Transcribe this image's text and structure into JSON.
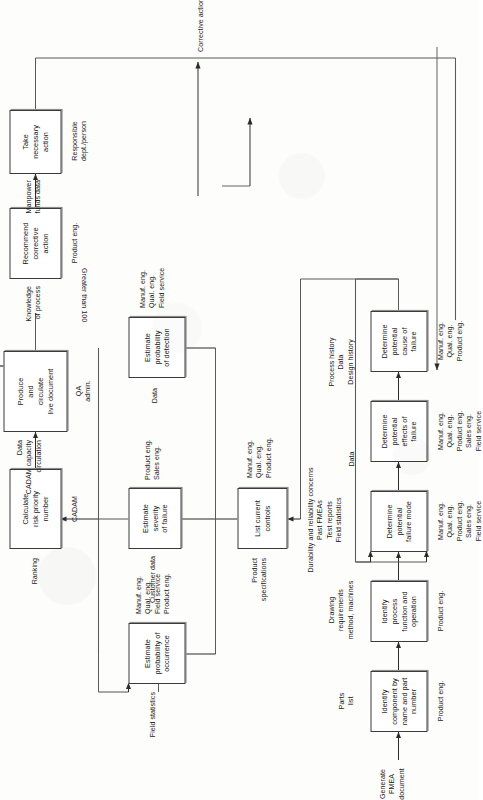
{
  "diagram": {
    "title_block": "Durability and reliability concerns\nPast FMEAs\nTest reports\nField statistics",
    "start_label": "Generate\nFMEA\ndocument",
    "terminal_label": "Less than 100\n\nNo action required",
    "loop_label": "Corrective action data",
    "branch_label": "Greater than 100",
    "stroke_color": "#3a3a3a",
    "text_color": "#161616",
    "boxes": [
      {
        "id": "b1",
        "text": "Identify\ncomponent by\nname and part\nnumber",
        "input": "Parts\nlist",
        "resource": "Product eng."
      },
      {
        "id": "b2",
        "text": "Identify\nprocess\nfunction and\noperation",
        "input": "Drawing\nrequirements\nmethod, machines",
        "resource": "Product eng."
      },
      {
        "id": "b3",
        "text": "Determine\npotential\nfailure mode",
        "input": "Durability and reliability concerns\nPast FMEAs\nTest reports\nField statistics",
        "resource": "Manuf. eng.\nQual. eng.\nProduct eng.\nSales eng.\nField service"
      },
      {
        "id": "b4",
        "text": "Determine\npotential\neffects of\nfailure",
        "input": "Data",
        "resource": "Manuf. eng.\nQual. eng.\nProduct eng.\nSales eng.\nField service"
      },
      {
        "id": "b5",
        "text": "Determine\npotential\ncause of\nfailure",
        "input": "Process history\nData\nDesign history",
        "resource": "Manuf. eng.\nQual. eng.\nProduct eng."
      },
      {
        "id": "b6",
        "text": "List current\ncontrols",
        "input": "Product\nspecifications",
        "resource": "Manuf. eng.\nQual. eng.\nProduct eng."
      },
      {
        "id": "b7",
        "text": "Estimate\nprobability of\noccurrence",
        "input": "Field statistics",
        "resource": "Manuf. eng.\nQual. eng.\nField service\nProduct eng."
      },
      {
        "id": "b8",
        "text": "Estimate\nseverity\nof failure",
        "input": "Customer data",
        "resource": "Product eng.\nSales eng."
      },
      {
        "id": "b9",
        "text": "Estimate\nprobability\nof detection",
        "input": "Data",
        "resource": "Manuf. eng.\nQual. eng.\nField service"
      },
      {
        "id": "b10",
        "text": "Calculate\nrisk priority\nnumber",
        "input": "Ranking",
        "resource": "CADAM"
      },
      {
        "id": "b11",
        "text": "Produce\nand\ncirculate\nlive document",
        "input": "Data\nCADAM capacity\ncirculation",
        "resource": "QA\nadmin."
      },
      {
        "id": "b12",
        "text": "Recommend\ncorrective\naction",
        "input": "Knowledge\nof process",
        "resource": "Product eng."
      },
      {
        "id": "b13",
        "text": "Take\nnecessary\naction",
        "input": "Manpower\nfunds data",
        "resource": "Responsible\ndept./person"
      }
    ]
  }
}
